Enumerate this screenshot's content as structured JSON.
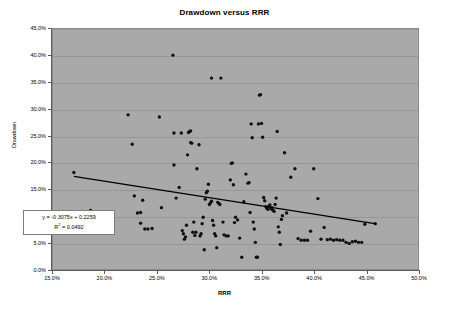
{
  "chart_data": {
    "type": "scatter",
    "title": "Drawdown versus RRR",
    "xlabel": "RRR",
    "ylabel": "Drawdown",
    "xlim": [
      0.15,
      0.5
    ],
    "ylim": [
      0.0,
      0.45
    ],
    "xticks": [
      "15.0%",
      "20.0%",
      "25.0%",
      "30.0%",
      "35.0%",
      "40.0%",
      "45.0%",
      "50.0%"
    ],
    "xtick_values": [
      0.15,
      0.2,
      0.25,
      0.3,
      0.35,
      0.4,
      0.45,
      0.5
    ],
    "yticks": [
      "0.0%",
      "5.0%",
      "10.0%",
      "15.0%",
      "20.0%",
      "25.0%",
      "30.0%",
      "35.0%",
      "40.0%",
      "45.0%"
    ],
    "ytick_values": [
      0.0,
      0.05,
      0.1,
      0.15,
      0.2,
      0.25,
      0.3,
      0.35,
      0.4,
      0.45
    ],
    "grid": "horizontal",
    "legend": "none",
    "plot_background": "#a9a9a9",
    "marker_color": "#101010",
    "trendline_color": "#000000",
    "annotations": {
      "equation": "y = -0.3075x + 0.2259",
      "r_squared_prefix": "R",
      "r_squared_sup": "2",
      "r_squared_value": " = 0.0492"
    },
    "trendline": {
      "slope": -0.3075,
      "intercept": 0.2259,
      "x_start": 0.17,
      "x_end": 0.46
    },
    "series": [
      {
        "name": "Drawdown vs RRR",
        "points": [
          [
            0.17,
            0.181
          ],
          [
            0.186,
            0.11
          ],
          [
            0.194,
            0.087
          ],
          [
            0.222,
            0.289
          ],
          [
            0.226,
            0.234
          ],
          [
            0.228,
            0.137
          ],
          [
            0.231,
            0.105
          ],
          [
            0.234,
            0.106
          ],
          [
            0.234,
            0.086
          ],
          [
            0.236,
            0.129
          ],
          [
            0.238,
            0.075
          ],
          [
            0.241,
            0.075
          ],
          [
            0.245,
            0.076
          ],
          [
            0.252,
            0.285
          ],
          [
            0.254,
            0.115
          ],
          [
            0.265,
            0.401
          ],
          [
            0.266,
            0.255
          ],
          [
            0.266,
            0.195
          ],
          [
            0.268,
            0.133
          ],
          [
            0.271,
            0.153
          ],
          [
            0.273,
            0.255
          ],
          [
            0.274,
            0.072
          ],
          [
            0.275,
            0.066
          ],
          [
            0.276,
            0.056
          ],
          [
            0.277,
            0.06
          ],
          [
            0.278,
            0.082
          ],
          [
            0.279,
            0.214
          ],
          [
            0.28,
            0.256
          ],
          [
            0.281,
            0.258
          ],
          [
            0.282,
            0.259
          ],
          [
            0.282,
            0.237
          ],
          [
            0.283,
            0.236
          ],
          [
            0.284,
            0.069
          ],
          [
            0.285,
            0.088
          ],
          [
            0.286,
            0.063
          ],
          [
            0.287,
            0.069
          ],
          [
            0.288,
            0.188
          ],
          [
            0.29,
            0.233
          ],
          [
            0.291,
            0.062
          ],
          [
            0.292,
            0.066
          ],
          [
            0.293,
            0.085
          ],
          [
            0.294,
            0.097
          ],
          [
            0.295,
            0.036
          ],
          [
            0.296,
            0.131
          ],
          [
            0.297,
            0.143
          ],
          [
            0.298,
            0.146
          ],
          [
            0.299,
            0.159
          ],
          [
            0.3,
            0.121
          ],
          [
            0.301,
            0.124
          ],
          [
            0.302,
            0.127
          ],
          [
            0.303,
            0.091
          ],
          [
            0.304,
            0.082
          ],
          [
            0.305,
            0.066
          ],
          [
            0.306,
            0.062
          ],
          [
            0.307,
            0.04
          ],
          [
            0.308,
            0.125
          ],
          [
            0.309,
            0.123
          ],
          [
            0.31,
            0.121
          ],
          [
            0.311,
            0.358
          ],
          [
            0.302,
            0.358
          ],
          [
            0.313,
            0.088
          ],
          [
            0.314,
            0.064
          ],
          [
            0.316,
            0.062
          ],
          [
            0.318,
            0.062
          ],
          [
            0.32,
            0.167
          ],
          [
            0.321,
            0.198
          ],
          [
            0.322,
            0.199
          ],
          [
            0.323,
            0.158
          ],
          [
            0.324,
            0.087
          ],
          [
            0.325,
            0.097
          ],
          [
            0.327,
            0.092
          ],
          [
            0.329,
            0.058
          ],
          [
            0.331,
            0.022
          ],
          [
            0.333,
            0.126
          ],
          [
            0.335,
            0.178
          ],
          [
            0.337,
            0.161
          ],
          [
            0.338,
            0.162
          ],
          [
            0.339,
            0.106
          ],
          [
            0.34,
            0.272
          ],
          [
            0.341,
            0.246
          ],
          [
            0.342,
            0.088
          ],
          [
            0.343,
            0.075
          ],
          [
            0.344,
            0.05
          ],
          [
            0.345,
            0.022
          ],
          [
            0.346,
            0.022
          ],
          [
            0.347,
            0.272
          ],
          [
            0.348,
            0.326
          ],
          [
            0.349,
            0.327
          ],
          [
            0.35,
            0.273
          ],
          [
            0.351,
            0.247
          ],
          [
            0.352,
            0.134
          ],
          [
            0.353,
            0.128
          ],
          [
            0.354,
            0.117
          ],
          [
            0.355,
            0.114
          ],
          [
            0.356,
            0.112
          ],
          [
            0.357,
            0.118
          ],
          [
            0.358,
            0.12
          ],
          [
            0.359,
            0.113
          ],
          [
            0.36,
            0.115
          ],
          [
            0.361,
            0.11
          ],
          [
            0.362,
            0.108
          ],
          [
            0.363,
            0.121
          ],
          [
            0.364,
            0.133
          ],
          [
            0.365,
            0.258
          ],
          [
            0.366,
            0.079
          ],
          [
            0.367,
            0.069
          ],
          [
            0.368,
            0.046
          ],
          [
            0.369,
            0.093
          ],
          [
            0.37,
            0.1
          ],
          [
            0.372,
            0.218
          ],
          [
            0.374,
            0.105
          ],
          [
            0.378,
            0.172
          ],
          [
            0.382,
            0.188
          ],
          [
            0.385,
            0.057
          ],
          [
            0.388,
            0.054
          ],
          [
            0.391,
            0.054
          ],
          [
            0.394,
            0.054
          ],
          [
            0.397,
            0.071
          ],
          [
            0.4,
            0.188
          ],
          [
            0.404,
            0.132
          ],
          [
            0.407,
            0.056
          ],
          [
            0.41,
            0.078
          ],
          [
            0.413,
            0.055
          ],
          [
            0.416,
            0.056
          ],
          [
            0.419,
            0.054
          ],
          [
            0.422,
            0.055
          ],
          [
            0.425,
            0.054
          ],
          [
            0.428,
            0.054
          ],
          [
            0.431,
            0.05
          ],
          [
            0.434,
            0.048
          ],
          [
            0.437,
            0.051
          ],
          [
            0.44,
            0.052
          ],
          [
            0.443,
            0.05
          ],
          [
            0.446,
            0.05
          ],
          [
            0.449,
            0.084
          ],
          [
            0.459,
            0.085
          ]
        ]
      }
    ]
  }
}
